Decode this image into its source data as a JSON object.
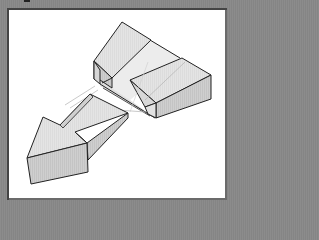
{
  "figure": {
    "type": "isometric-diagram",
    "colors": {
      "background": "#8a8a8a",
      "panel": "#ffffff",
      "outline": "#222222",
      "face_light": "#e6e6e6",
      "face_mid": "#d2d2d2",
      "face_dark": "#bdbdbd",
      "guide_line": "#bbbbbb"
    },
    "parts": [
      {
        "name": "top-wedge"
      },
      {
        "name": "right-block"
      },
      {
        "name": "slot-channel"
      },
      {
        "name": "arrow-piece"
      }
    ]
  }
}
